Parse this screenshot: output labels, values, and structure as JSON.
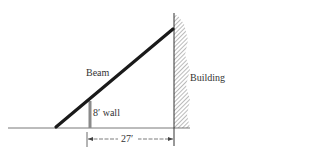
{
  "labels": {
    "beam": "Beam",
    "wall": "8′ wall",
    "building": "Building",
    "distance": "27′"
  },
  "colors": {
    "line": "#222222",
    "wall": "#8a8a8a",
    "hatch": "#555555"
  }
}
